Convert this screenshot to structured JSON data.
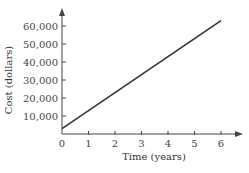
{
  "chart_data": {
    "type": "line",
    "title": "",
    "xlabel": "Time (years)",
    "ylabel": "Cost (dollars)",
    "x_ticks": [
      "0",
      "1",
      "2",
      "3",
      "4",
      "5",
      "6"
    ],
    "y_ticks": [
      "10,000",
      "20,000",
      "30,000",
      "40,000",
      "50,000",
      "60,000"
    ],
    "xlim": [
      0,
      6.5
    ],
    "ylim": [
      0,
      66000
    ],
    "grid": false,
    "legend": null,
    "series": [
      {
        "name": "Cost",
        "x": [
          0,
          6
        ],
        "y": [
          3000,
          63000
        ]
      }
    ],
    "line_color": "#333333"
  }
}
